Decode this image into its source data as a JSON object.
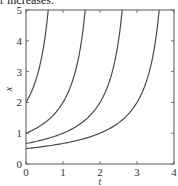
{
  "caption": "r increases.",
  "chart_data": {
    "type": "line",
    "title": "",
    "xlabel": "t",
    "ylabel": "x",
    "xlim": [
      0,
      4
    ],
    "ylim": [
      0,
      5
    ],
    "xticks": [
      0,
      1,
      2,
      3,
      4
    ],
    "yticks": [
      0,
      1,
      2,
      3,
      4,
      5
    ],
    "grid": false,
    "legend": null,
    "line_color": "#4a4a4a",
    "series": [
      {
        "name": "x0=2",
        "formula": "x = 2/(1 - t)",
        "x": [
          0,
          0.2,
          0.4,
          0.5,
          0.6
        ],
        "y": [
          2.0,
          2.5,
          3.33,
          4.0,
          5.0
        ]
      },
      {
        "name": "x0=1",
        "formula": "x = 2/(2 - t)",
        "x": [
          0,
          0.4,
          0.8,
          1.0,
          1.2,
          1.4,
          1.5,
          1.6
        ],
        "y": [
          1.0,
          1.25,
          1.67,
          2.0,
          2.5,
          3.33,
          4.0,
          5.0
        ]
      },
      {
        "name": "x0=2/3",
        "formula": "x = 2/(3 - t)",
        "x": [
          0,
          0.5,
          1.0,
          1.5,
          2.0,
          2.2,
          2.4,
          2.5,
          2.6
        ],
        "y": [
          0.67,
          0.8,
          1.0,
          1.33,
          2.0,
          2.5,
          3.33,
          4.0,
          5.0
        ]
      },
      {
        "name": "x0=1/2",
        "formula": "x = 2/(4 - t)",
        "x": [
          0,
          1.0,
          2.0,
          2.5,
          3.0,
          3.2,
          3.4,
          3.5,
          3.6
        ],
        "y": [
          0.5,
          0.67,
          1.0,
          1.33,
          2.0,
          2.5,
          3.33,
          4.0,
          5.0
        ]
      }
    ],
    "curve_constants": [
      1,
      2,
      3,
      4
    ]
  }
}
